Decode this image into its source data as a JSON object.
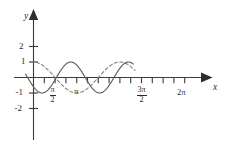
{
  "figure": {
    "kind": "trigonometric-function-graph",
    "background_color": "#ffffff",
    "axis_color": "#3a3a3a",
    "solid_curve_color": "#5e5e5e",
    "dashed_curve_color": "#7d7d7d"
  },
  "axes": {
    "x_axis_name": "x",
    "y_axis_name": "y",
    "x_tick_labels": [
      {
        "id": "pi-over-2",
        "numerator": "π",
        "denominator": "2"
      },
      {
        "id": "pi",
        "text": "π"
      },
      {
        "id": "three-pi-over-2",
        "numerator": "3π",
        "denominator": "2"
      },
      {
        "id": "two-pi",
        "text": "2π"
      }
    ],
    "y_tick_labels": [
      "2",
      "1",
      "-1",
      "-2"
    ],
    "y_tick_values": [
      2,
      1,
      -1,
      -2
    ],
    "x_tick_values_pi": [
      0.25,
      0.5,
      0.75,
      1.0,
      1.25,
      1.5,
      1.75,
      2.0
    ],
    "xlim_pi": [
      -0.18,
      2.35
    ],
    "ylim": [
      -2.45,
      2.45
    ],
    "grid": false,
    "legend": "none"
  },
  "chart_data": {
    "type": "line",
    "title": "",
    "xlabel": "x",
    "ylabel": "y",
    "xlim": [
      -0.565,
      7.383
    ],
    "ylim": [
      -2.45,
      2.45
    ],
    "grid": false,
    "legend_position": "none",
    "x_tick_labels": [
      "π/2",
      "π",
      "3π/2",
      "2π"
    ],
    "x_tick_positions": [
      1.5708,
      3.1416,
      4.7124,
      6.2832
    ],
    "y_tick_labels": [
      "2",
      "1",
      "-1",
      "-2"
    ],
    "y_tick_positions": [
      2,
      1,
      -1,
      -2
    ],
    "series": [
      {
        "name": "solid-curve",
        "style": "solid",
        "color": "#5e5e5e",
        "amplitude": 1,
        "period": 4.1888,
        "expression": "sin(1.5x - 2.5)",
        "x": [
          -0.57,
          -0.31,
          -0.05,
          0.21,
          0.47,
          0.73,
          0.99,
          1.25,
          1.51,
          1.78,
          2.04,
          2.3,
          2.56,
          2.82,
          3.08,
          3.34,
          3.6,
          3.86,
          4.12,
          4.38,
          4.64,
          4.91,
          5.17,
          5.43,
          5.69,
          5.95,
          6.21,
          6.47,
          6.73,
          6.99,
          7.25
        ],
        "y": [
          -0.98,
          -1.0,
          -0.91,
          -0.71,
          -0.42,
          -0.08,
          0.28,
          0.59,
          0.83,
          0.98,
          1.0,
          0.9,
          0.69,
          0.4,
          0.05,
          -0.3,
          -0.61,
          -0.85,
          -0.98,
          -1.0,
          -0.89,
          -0.67,
          -0.37,
          -0.02,
          0.33,
          0.63,
          0.86,
          0.99,
          1.0,
          0.88,
          0.65
        ]
      },
      {
        "name": "dashed-curve",
        "style": "dashed",
        "color": "#7d7d7d",
        "amplitude": 1,
        "period": 6.2832,
        "expression": "cos(x)",
        "x": [
          -0.2,
          0.0,
          0.39,
          0.79,
          1.18,
          1.57,
          1.96,
          2.36,
          2.75,
          3.14,
          3.53,
          3.93,
          4.32,
          4.71,
          5.11,
          5.5,
          5.89,
          6.28,
          6.68,
          7.07,
          7.38
        ],
        "y": [
          0.98,
          1.0,
          0.92,
          0.71,
          0.38,
          0.0,
          -0.38,
          -0.71,
          -0.92,
          -1.0,
          -0.92,
          -0.71,
          -0.38,
          0.0,
          0.38,
          0.71,
          0.92,
          1.0,
          0.96,
          0.79,
          0.62
        ]
      }
    ]
  }
}
